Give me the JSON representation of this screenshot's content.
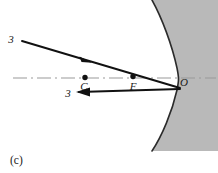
{
  "figure": {
    "panel_label": "(c)",
    "kind": "ray-diagram",
    "colors": {
      "mirror_fill": "#b9b9b9",
      "mirror_stroke": "#2b2b2b",
      "ray_stroke": "#111111",
      "axis_stroke": "#9a9a9a",
      "point_fill": "#111111",
      "background": "#ffffff",
      "text": "#1a1a1a"
    },
    "labels": {
      "incident_ray": "3",
      "reflected_ray": "3",
      "center_of_curvature": "C",
      "focal_point": "F",
      "vertex": "O"
    },
    "points": {
      "center_of_curvature": {
        "x": 85,
        "y": 78
      },
      "focal_point": {
        "x": 133,
        "y": 77
      },
      "vertex": {
        "x": 180,
        "y": 78
      }
    },
    "axis": {
      "style": "dash-dot",
      "x_start": 13,
      "x_end": 215,
      "y": 78
    },
    "rays": [
      {
        "name": "incident-ray-3",
        "from": {
          "x": 22,
          "y": 41
        },
        "to": {
          "x": 180,
          "y": 88
        },
        "arrow_at": {
          "x": 86,
          "y": 60
        },
        "direction": "rightward-down",
        "label": "3"
      },
      {
        "name": "reflected-ray-3",
        "from": {
          "x": 180,
          "y": 89
        },
        "to": {
          "x": 78,
          "y": 92
        },
        "arrow_at": {
          "x": 80,
          "y": 92
        },
        "direction": "leftward",
        "label": "3"
      }
    ],
    "mirror": {
      "name": "concave-mirror",
      "vertex_x": 180,
      "top_x": 152,
      "bottom_x": 152,
      "top_y": 0,
      "bottom_y": 151
    }
  }
}
